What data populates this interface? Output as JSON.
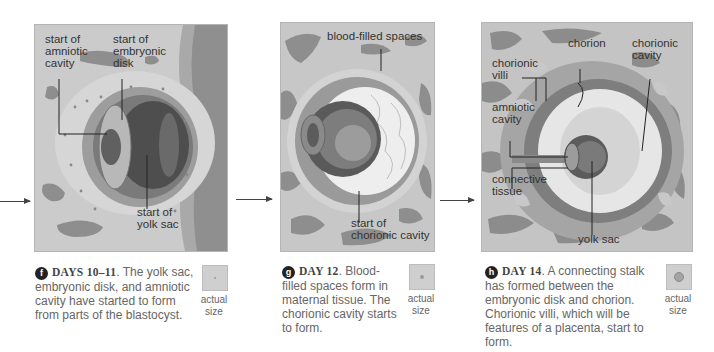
{
  "panels": [
    {
      "id": "f",
      "badge": "f",
      "day_label": "DAYS 10–11",
      "caption_text": ". The yolk sac, embryonic disk, and amniotic cavity have started to form from parts of the blastocyst.",
      "labels": {
        "amniotic": "start of\namniotic\ncavity",
        "disk": "start of\nembryonic\ndisk",
        "yolk": "start of\nyolk sac"
      },
      "actual_size": "actual\nsize"
    },
    {
      "id": "g",
      "badge": "g",
      "day_label": "DAY 12",
      "caption_text": ". Blood-filled spaces form in maternal tissue. The chorionic cavity starts to form.",
      "labels": {
        "blood": "blood-filled spaces",
        "chorionic_cavity": "start of\nchorionic cavity"
      },
      "actual_size": "actual\nsize"
    },
    {
      "id": "h",
      "badge": "h",
      "day_label": "DAY 14",
      "caption_text": ". A connecting stalk has formed between the embryonic disk and chorion. Chorionic villi, which will be features of a placenta, start to form.",
      "labels": {
        "chorion": "chorion",
        "chorionic_cavity": "chorionic\ncavity",
        "villi": "chorionic\nvilli",
        "amniotic": "amniotic\ncavity",
        "connective": "connective\ntissue",
        "yolk": "yolk sac"
      },
      "actual_size": "actual\nsize"
    }
  ],
  "colors": {
    "tissue_bg": "#c9c9c9",
    "blood_spaces": "#8e8e8e",
    "cavity_light": "#efefef",
    "sac_dark": "#555555"
  }
}
